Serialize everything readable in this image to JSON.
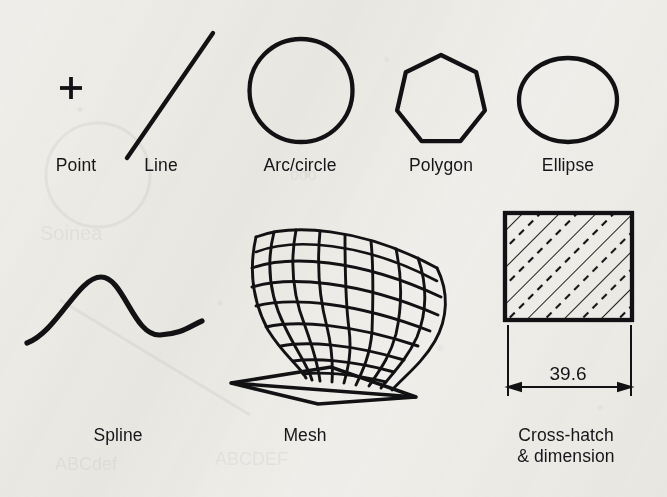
{
  "figure": {
    "kind": "cad-geometric-entities-chart",
    "background_color": "#efeeea",
    "ink_color": "#121214",
    "width": 667,
    "height": 497,
    "rows": 2,
    "columns_top": 5,
    "columns_bottom": 3
  },
  "entities": {
    "point": {
      "label": "Point",
      "glyph": "plus-marker",
      "label_x": 76,
      "label_y": 164,
      "marker": {
        "cx": 71,
        "cy": 88,
        "arm": 11,
        "stroke": 4
      }
    },
    "line": {
      "label": "Line",
      "glyph": "diagonal-segment",
      "label_x": 161,
      "label_y": 164,
      "segment": {
        "x1": 127,
        "y1": 158,
        "x2": 213,
        "y2": 33,
        "stroke": 4.4
      }
    },
    "arc_circle": {
      "label": "Arc/circle",
      "glyph": "circle-outline",
      "label_x": 300,
      "label_y": 164,
      "circle": {
        "cx": 301,
        "cy": 90.5,
        "r": 51.5,
        "stroke": 4.2
      }
    },
    "polygon": {
      "label": "Polygon",
      "glyph": "heptagon-outline",
      "sides": 7,
      "label_x": 441,
      "label_y": 164,
      "shape": {
        "cx": 441,
        "cy": 100,
        "r": 45,
        "rotation_deg": -90,
        "stroke": 4.2
      }
    },
    "ellipse": {
      "label": "Ellipse",
      "glyph": "ellipse-outline",
      "label_x": 568,
      "label_y": 164,
      "shape": {
        "cx": 568,
        "cy": 100,
        "rx": 49,
        "ry": 42,
        "stroke": 4.2
      }
    },
    "spline": {
      "label": "Spline",
      "glyph": "s-curve",
      "label_x": 118,
      "label_y": 434,
      "path": "M27,343 C57,332 78,277 101,277 C124,277 133,336 160,335 C182,334 190,326 202,321",
      "stroke": 5.2
    },
    "mesh": {
      "label": "Mesh",
      "glyph": "goblet-wireframe-surface",
      "label_x": 305,
      "label_y": 434,
      "u_divisions": 8,
      "v_divisions": 9,
      "stroke": 3.0,
      "description": "goblet / wineglass shaped parametric surface on flared flat base"
    },
    "crosshatch": {
      "label_line_1": "Cross-hatch",
      "label_line_2": "& dimension",
      "label_x": 566,
      "label_y": 424,
      "glyph": "hatched-square-with-dimension",
      "square": {
        "x": 505,
        "y": 213,
        "w": 127,
        "h": 107,
        "stroke": 4.2
      },
      "hatch": {
        "angle_deg": 45,
        "spacing": 13,
        "pattern": "alternating-solid-and-dashed",
        "stroke": 1.8,
        "dash": "7 6"
      },
      "dimension": {
        "value": "39.6",
        "text_x": 568,
        "text_y": 363,
        "extension_line_left_x": 508,
        "extension_line_right_x": 631,
        "extension_top_y": 325,
        "extension_bottom_y": 395,
        "dim_line_y": 387,
        "arrow_size": 9,
        "stroke": 1.9
      }
    }
  }
}
